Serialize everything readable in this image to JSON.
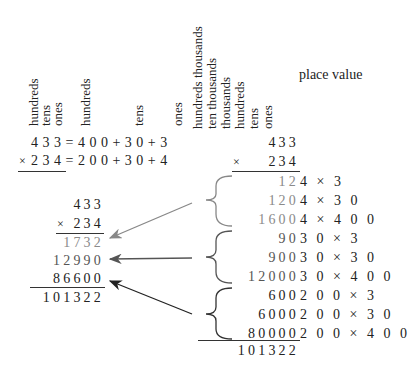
{
  "left_headers": {
    "digit_columns": [
      "hundreds",
      "tens",
      "ones"
    ],
    "expanded_columns": [
      "hundreds",
      "tens",
      "ones"
    ]
  },
  "expansion": {
    "row1": "4 3 3 = 4 0 0 + 3 0 + 3",
    "row2_op": "×",
    "row2": "2 3 4 = 2 0 0 + 3 0 + 4"
  },
  "left_mult": {
    "multiplicand": "433",
    "op": "×",
    "multiplier": "234",
    "partials": [
      "1732",
      "12990",
      "86600"
    ],
    "result": "101322"
  },
  "right_headers": {
    "columns": [
      "hundreds thousands",
      "ten thousands",
      "thousands",
      "hundreds",
      "tens",
      "ones"
    ],
    "place_value_label": "place value"
  },
  "right_mult": {
    "multiplicand": "433",
    "op": "×",
    "multiplier": "234",
    "partials": [
      {
        "value": "12",
        "expr": "4 × 3"
      },
      {
        "value": "120",
        "expr": "4 × 3 0"
      },
      {
        "value": "1600",
        "expr": "4 × 4 0 0"
      },
      {
        "value": "90",
        "expr": "3 0 × 3"
      },
      {
        "value": "900",
        "expr": "3 0 × 3 0"
      },
      {
        "value": "12000",
        "expr": "3 0 × 4 0 0"
      },
      {
        "value": "600",
        "expr": "2 0 0 × 3"
      },
      {
        "value": "6000",
        "expr": "2 0 0 × 3 0"
      },
      {
        "value": "80000",
        "expr": "2 0 0 × 4 0 0"
      }
    ],
    "result": "101322"
  },
  "colors": {
    "text": "#222222",
    "partial_light": "#8a8a8a",
    "arrow1": "#888888",
    "arrow2": "#555555",
    "arrow3": "#222222"
  }
}
